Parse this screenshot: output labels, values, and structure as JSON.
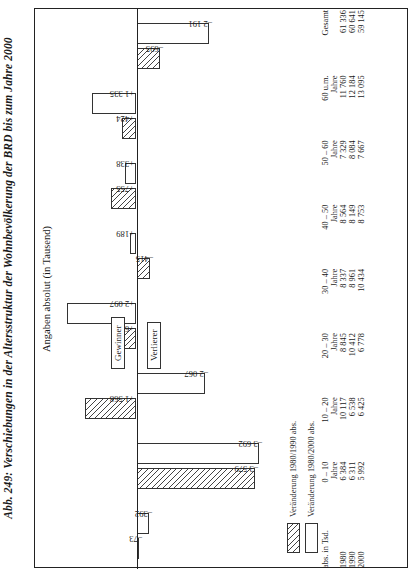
{
  "figure": {
    "title": "Abb. 249: Verschiebungen in der Altersstruktur der Wohnbevölkerung der BRD bis zum Jahre 2000",
    "subtitle": "Angaben absolut (in Tausend)"
  },
  "legend": {
    "items": [
      {
        "label": "Veränderung 1980/1990 abs.",
        "style": "hatched"
      },
      {
        "label": "Veränderung 1980/2000 abs.",
        "style": "open"
      }
    ],
    "winner_label": "Gewinner",
    "loser_label": "Verlierer"
  },
  "table": {
    "corner": "abs. in Tsd.",
    "unit_row": "Jahre",
    "row_labels": [
      "1980",
      "1990",
      "2000"
    ],
    "columns": [
      {
        "group": "0 – 10",
        "unit": "Jahre",
        "values": [
          "6 384",
          "6 311",
          "5 992"
        ]
      },
      {
        "group": "10 – 20",
        "unit": "Jahre",
        "values": [
          "10 117",
          "6 538",
          "6 425"
        ]
      },
      {
        "group": "20 – 30",
        "unit": "Jahre",
        "values": [
          "8 845",
          "10 412",
          "6 778"
        ]
      },
      {
        "group": "30 – 40",
        "unit": "Jahre",
        "values": [
          "8 337",
          "8 961",
          "10 434"
        ]
      },
      {
        "group": "40 – 50",
        "unit": "Jahre",
        "values": [
          "8 564",
          "8 149",
          "8 753"
        ]
      },
      {
        "group": "50 – 60",
        "unit": "Jahre",
        "values": [
          "7 329",
          "8 084",
          "7 667"
        ]
      },
      {
        "group": "60 u.m.",
        "unit": "Jahre",
        "values": [
          "11 760",
          "12 184",
          "13 095"
        ]
      },
      {
        "group": "Gesamt",
        "unit": "",
        "values": [
          "61 336",
          "60 641",
          "59 145"
        ]
      }
    ]
  },
  "chart_data": {
    "type": "bar",
    "title": "Abb. 249: Verschiebungen in der Altersstruktur der Wohnbevölkerung der BRD bis zum Jahre 2000",
    "subtitle": "Angaben absolut (in Tausend)",
    "xlabel": "",
    "ylabel": "Angaben absolut (in Tausend)",
    "ylim": [
      -4000,
      2400
    ],
    "grid": false,
    "legend_position": "bottom-left",
    "categories": [
      "0 – 10 Jahre",
      "10 – 20 Jahre",
      "20 – 30 Jahre",
      "30 – 40 Jahre",
      "40 – 50 Jahre",
      "50 – 60 Jahre",
      "60 u.m. Jahre"
    ],
    "series": [
      {
        "name": "Veränderung 1980/1990 abs.",
        "values": [
          -73,
          -3579,
          1568,
          624,
          -415,
          755,
          424
        ]
      },
      {
        "name": "Veränderung 1980/2000 abs.",
        "values": [
          -392,
          -3692,
          -2067,
          2097,
          189,
          338,
          1335
        ]
      }
    ],
    "point_labels": {
      "Veränderung 1980/1990 abs.": [
        "–73",
        "–3 579",
        "+1 568",
        "+624",
        "–415",
        "+755",
        "+424"
      ],
      "Veränderung 1980/2000 abs.": [
        "–392",
        "–3 692",
        "–2 067",
        "+2 097",
        "+189",
        "+338",
        "+1 335"
      ]
    },
    "extra_bars": [
      {
        "category": "Gesamt",
        "series": "Veränderung 1980/1990 abs.",
        "value": -695,
        "label": "–695"
      },
      {
        "category": "Gesamt",
        "series": "Veränderung 1980/2000 abs.",
        "value": -2191,
        "label": "–2 191"
      }
    ]
  }
}
